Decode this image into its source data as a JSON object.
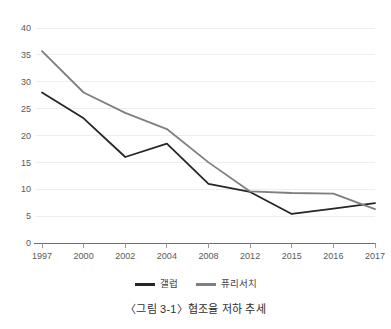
{
  "caption": "〈그림 3-1〉협조율 저하 추세",
  "legend": {
    "position": "bottom-center",
    "entries": [
      {
        "label": "갤럽",
        "color": "#262626",
        "swatch_name": "legend-swatch-gallup"
      },
      {
        "label": "퓨리서치",
        "color": "#7f7f7f",
        "swatch_name": "legend-swatch-pew"
      }
    ]
  },
  "chart_data": {
    "type": "line",
    "title": "",
    "subtitle": "",
    "xlabel": "",
    "ylabel": "",
    "categories": [
      "1997",
      "2000",
      "2002",
      "2004",
      "2008",
      "2012",
      "2015",
      "2016",
      "2017"
    ],
    "ylim": [
      0,
      40
    ],
    "yticks": [
      0,
      5,
      10,
      15,
      20,
      25,
      30,
      35,
      40
    ],
    "ytick_labels": [
      "0",
      "5",
      "10",
      "15",
      "20",
      "25",
      "30",
      "35",
      "40"
    ],
    "grid": true,
    "legend_position": "bottom",
    "series": [
      {
        "name": "갤럽",
        "color": "#262626",
        "values": [
          28,
          23.2,
          16,
          18.5,
          11,
          9.5,
          5.4,
          6.4,
          7.4
        ]
      },
      {
        "name": "퓨리서치",
        "color": "#7f7f7f",
        "values": [
          35.7,
          28,
          24.2,
          21.2,
          15,
          9.6,
          9.3,
          9.2,
          6.3
        ]
      }
    ]
  }
}
